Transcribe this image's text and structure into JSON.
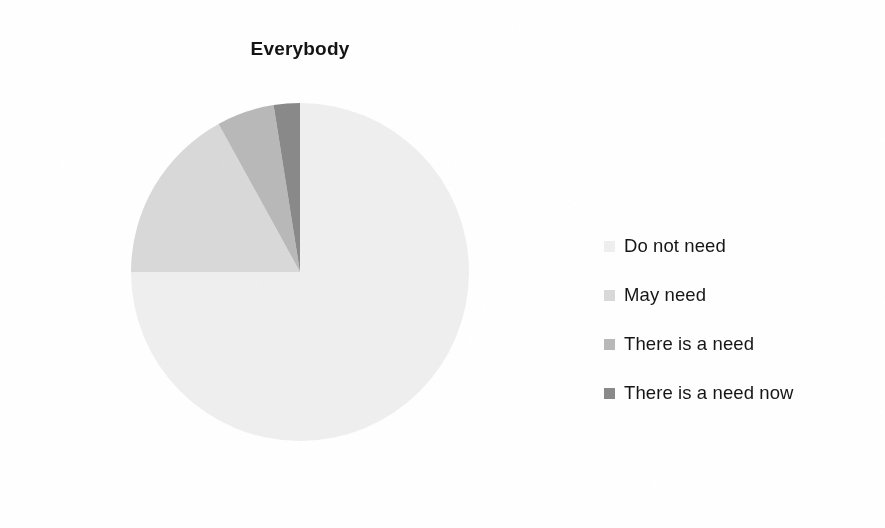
{
  "chart_data": {
    "type": "pie",
    "title": "Everybody",
    "xlabel": "",
    "ylabel": "",
    "legend_position": "right",
    "grid": false,
    "start_angle_deg": 0,
    "direction": "clockwise",
    "categories": [
      "Do not need",
      "May need",
      "There is a need",
      "There is a need now"
    ],
    "values": [
      75,
      17,
      5.5,
      2.5
    ],
    "slices": [
      {
        "label": "Do not need",
        "value": 75,
        "color": "#efefef",
        "start_deg": 0,
        "sweep_deg": 270
      },
      {
        "label": "May need",
        "value": 17,
        "color": "#d9d9d9",
        "start_deg": 270,
        "sweep_deg": 61.2
      },
      {
        "label": "There is a need",
        "value": 5.5,
        "color": "#b9b9b9",
        "start_deg": 331.2,
        "sweep_deg": 19.8
      },
      {
        "label": "There is a need now",
        "value": 2.5,
        "color": "#8a8a8a",
        "start_deg": 351.0,
        "sweep_deg": 9.0
      }
    ]
  },
  "chart": {
    "title": "Everybody"
  },
  "legend": {
    "items": [
      {
        "label": "Do not need",
        "color": "#efefef"
      },
      {
        "label": "May need",
        "color": "#d9d9d9"
      },
      {
        "label": "There is a need",
        "color": "#b9b9b9"
      },
      {
        "label": "There is a need now",
        "color": "#8a8a8a"
      }
    ]
  },
  "colors": {
    "background": "#ffffff",
    "text": "#161616",
    "slice_1": "#efefef",
    "slice_2": "#d9d9d9",
    "slice_3": "#b9b9b9",
    "slice_4": "#8a8a8a"
  }
}
